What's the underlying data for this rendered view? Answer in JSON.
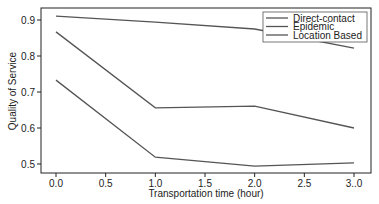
{
  "chart_data": {
    "type": "line",
    "title": "",
    "xlabel": "Transportation time (hour)",
    "ylabel": "Quality of Service",
    "x": [
      0.0,
      1.0,
      2.0,
      3.0
    ],
    "xticks": [
      0.0,
      0.5,
      1.0,
      1.5,
      2.0,
      2.5,
      3.0
    ],
    "xtick_labels": [
      "0.0",
      "0.5",
      "1.0",
      "1.5",
      "2.0",
      "2.5",
      "3..0"
    ],
    "yticks": [
      0.5,
      0.6,
      0.7,
      0.8,
      0.9
    ],
    "ytick_labels": [
      "0.5",
      "0.6",
      "0.7",
      "0.8",
      "0.9"
    ],
    "xlim": [
      -0.15,
      3.05
    ],
    "ylim": [
      0.475,
      0.932
    ],
    "grid": false,
    "legend_position": "upper right",
    "series": [
      {
        "name": "Direct-contact",
        "values": [
          0.911,
          0.894,
          0.875,
          0.822
        ],
        "color": "#555555"
      },
      {
        "name": "Epidemic",
        "values": [
          0.867,
          0.656,
          0.661,
          0.6
        ],
        "color": "#555555"
      },
      {
        "name": "Location Based",
        "values": [
          0.733,
          0.519,
          0.494,
          0.503
        ],
        "color": "#555555"
      }
    ]
  }
}
